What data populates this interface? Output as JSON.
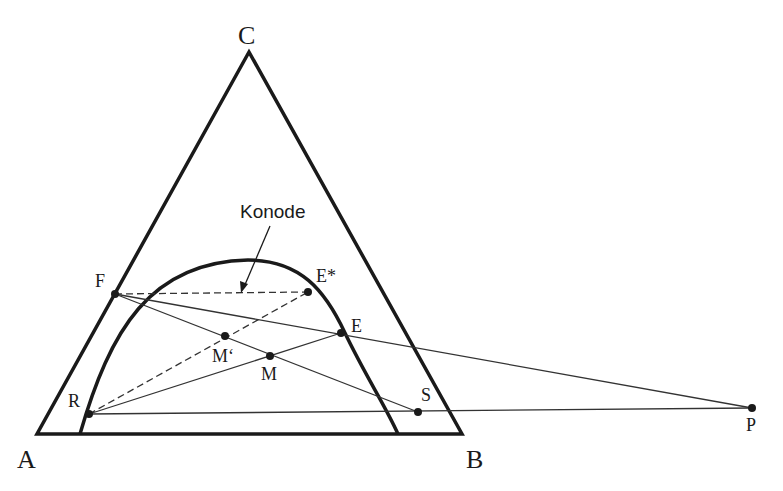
{
  "colors": {
    "line": "#1a1a1a",
    "thin_line": "#333333",
    "background": "#ffffff"
  },
  "vertices": {
    "A": {
      "label": "A",
      "x": 37,
      "y": 434
    },
    "B": {
      "label": "B",
      "x": 462,
      "y": 434
    },
    "C": {
      "label": "C",
      "x": 249,
      "y": 52
    }
  },
  "points": {
    "F": {
      "label": "F",
      "x": 115,
      "y": 294
    },
    "E_star": {
      "label": "E*",
      "x": 308,
      "y": 292
    },
    "E": {
      "label": "E",
      "x": 341,
      "y": 333
    },
    "M_prime": {
      "label": "M‘",
      "x": 225,
      "y": 336
    },
    "M": {
      "label": "M",
      "x": 270,
      "y": 356
    },
    "R": {
      "label": "R",
      "x": 89,
      "y": 414
    },
    "S": {
      "label": "S",
      "x": 418,
      "y": 412
    },
    "P": {
      "label": "P",
      "x": 752,
      "y": 408
    }
  },
  "annotation": {
    "text": "Konode",
    "x": 240,
    "y": 218
  },
  "binodal_curve": {
    "start": {
      "x": 80,
      "y": 434
    },
    "peak": {
      "x": 248,
      "y": 260
    },
    "end": {
      "x": 398,
      "y": 434
    }
  }
}
